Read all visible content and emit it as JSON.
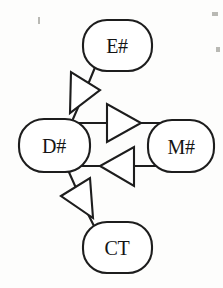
{
  "diagram": {
    "kind": "generalization-graph",
    "background_color": "#fdfdfc",
    "stroke_color": "#1d1d1d",
    "fill_color": "#ffffff",
    "nodes": [
      {
        "id": "e",
        "label": "E#",
        "shape": "rounded-rectangle",
        "cx": 117,
        "cy": 45
      },
      {
        "id": "d",
        "label": "D#",
        "shape": "rounded-rectangle",
        "cx": 54,
        "cy": 145
      },
      {
        "id": "m",
        "label": "M#",
        "shape": "rounded-rectangle",
        "cx": 181,
        "cy": 146
      },
      {
        "id": "ct",
        "label": "CT",
        "shape": "rounded-rectangle",
        "cx": 117,
        "cy": 247
      }
    ],
    "edges": [
      {
        "id": "e-to-d",
        "from": "E#",
        "to": "D#",
        "arrow": "hollow-triangle",
        "points_to": "D#",
        "direction": "down-left"
      },
      {
        "id": "d-to-m",
        "from": "D#",
        "to": "M#",
        "arrow": "hollow-triangle",
        "points_to": "M#",
        "direction": "right"
      },
      {
        "id": "m-to-d",
        "from": "M#",
        "to": "D#",
        "arrow": "hollow-triangle",
        "points_to": "D#",
        "direction": "left"
      },
      {
        "id": "ct-to-d",
        "from": "CT",
        "to": "D#",
        "arrow": "hollow-triangle",
        "points_to": "D#",
        "direction": "up-left"
      }
    ]
  }
}
